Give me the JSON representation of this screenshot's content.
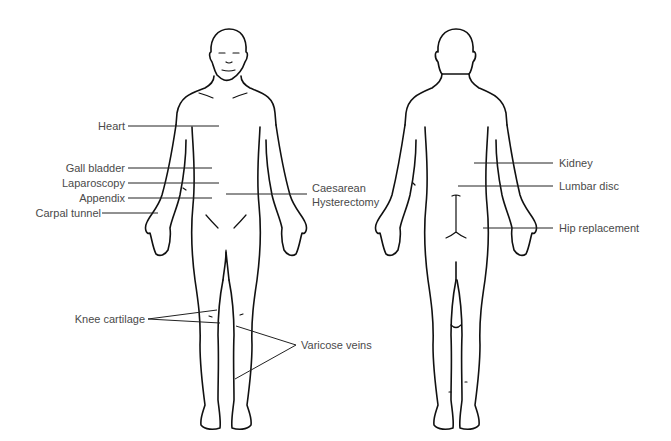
{
  "diagram": {
    "views": [
      "front",
      "back"
    ],
    "front_labels": [
      {
        "id": "heart",
        "text": "Heart"
      },
      {
        "id": "gall-bladder",
        "text": "Gall bladder"
      },
      {
        "id": "laparoscopy",
        "text": "Laparoscopy"
      },
      {
        "id": "appendix",
        "text": "Appendix"
      },
      {
        "id": "carpal-tunnel",
        "text": "Carpal tunnel"
      },
      {
        "id": "caesarean",
        "text": "Caesarean"
      },
      {
        "id": "hysterectomy",
        "text": "Hysterectomy"
      },
      {
        "id": "knee-cartilage",
        "text": "Knee cartilage"
      },
      {
        "id": "varicose-veins",
        "text": "Varicose veins"
      }
    ],
    "back_labels": [
      {
        "id": "kidney",
        "text": "Kidney"
      },
      {
        "id": "lumbar-disc",
        "text": "Lumbar disc"
      },
      {
        "id": "hip-replacement",
        "text": "Hip replacement"
      }
    ],
    "colors": {
      "outline": "#111111",
      "label_text": "#4a4a4a",
      "background": "#ffffff"
    }
  }
}
